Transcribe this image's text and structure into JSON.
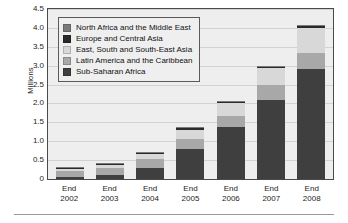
{
  "chart_data": {
    "type": "bar",
    "subtype": "stacked-vertical",
    "title": "",
    "xlabel": "",
    "ylabel": "Millions",
    "ylim": [
      0,
      4.5
    ],
    "ytick_step": 0.5,
    "grid": true,
    "legend_position": "upper-left-inside",
    "categories": [
      "End 2002",
      "End 2003",
      "End 2004",
      "End 2005",
      "End 2006",
      "End 2007",
      "End 2008"
    ],
    "category_lines": [
      [
        "End",
        "2002"
      ],
      [
        "End",
        "2003"
      ],
      [
        "End",
        "2004"
      ],
      [
        "End",
        "2005"
      ],
      [
        "End",
        "2006"
      ],
      [
        "End",
        "2007"
      ],
      [
        "End",
        "2008"
      ]
    ],
    "ytick_labels": [
      "4.5",
      "4.0",
      "3.5",
      "3.0",
      "2.5",
      "2.0",
      "1.5",
      "1.0",
      "0.5",
      "0"
    ],
    "ytick_values": [
      4.5,
      4.0,
      3.5,
      3.0,
      2.5,
      2.0,
      1.5,
      1.0,
      0.5,
      0
    ],
    "stack_order_bottom_to_top": [
      "Sub-Saharan Africa",
      "Latin America and the Caribbean",
      "East, South and South-East Asia",
      "Europe and Central Asia",
      "North Africa and the Middle East"
    ],
    "series": [
      {
        "name": "Sub-Saharan Africa",
        "color": "#3f3f3f",
        "values": [
          0.05,
          0.1,
          0.28,
          0.8,
          1.37,
          2.1,
          2.92
        ]
      },
      {
        "name": "Latin America and the Caribbean",
        "color": "#a8a8a8",
        "values": [
          0.16,
          0.19,
          0.26,
          0.26,
          0.3,
          0.4,
          0.42
        ]
      },
      {
        "name": "East, South and South-East Asia",
        "color": "#d8d8d8",
        "values": [
          0.05,
          0.09,
          0.13,
          0.25,
          0.33,
          0.44,
          0.66
        ]
      },
      {
        "name": "Europe and Central Asia",
        "color": "#2a2a2a",
        "values": [
          0.01,
          0.01,
          0.02,
          0.03,
          0.04,
          0.03,
          0.04
        ]
      },
      {
        "name": "North Africa and the Middle East",
        "color": "#7a7a7a",
        "values": [
          0.01,
          0.01,
          0.01,
          0.01,
          0.01,
          0.01,
          0.01
        ]
      }
    ],
    "totals": [
      0.28,
      0.4,
      0.7,
      1.35,
      2.05,
      2.98,
      4.05
    ]
  },
  "legend": {
    "entries": [
      {
        "label": "North Africa and the Middle East",
        "color": "#7a7a7a"
      },
      {
        "label": "Europe and Central Asia",
        "color": "#2a2a2a"
      },
      {
        "label": "East, South and South-East Asia",
        "color": "#d8d8d8"
      },
      {
        "label": "Latin America and the Caribbean",
        "color": "#a8a8a8"
      },
      {
        "label": "Sub-Saharan Africa",
        "color": "#3f3f3f"
      }
    ]
  },
  "style": {
    "plot_background": "#eeeeee",
    "gridline_color": "#d2d2d2",
    "axis_color": "#4a4a4a",
    "page_background": "#ffffff"
  }
}
